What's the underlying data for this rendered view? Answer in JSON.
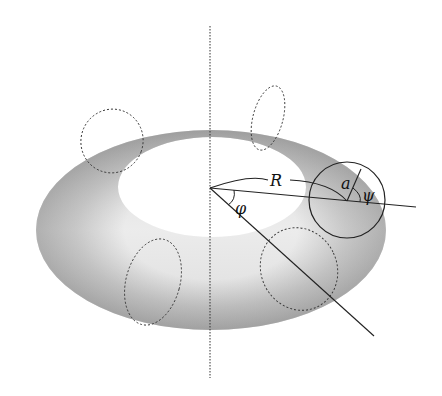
{
  "diagram": {
    "labels": {
      "major_radius": "R",
      "minor_radius": "a",
      "toroidal_angle": "φ",
      "poloidal_angle": "ψ"
    },
    "elements": [
      "vertical symmetry axis (dotted)",
      "shaded torus surface",
      "dashed cross-section ellipses (4)",
      "solid cross-section circle",
      "major radius arc R",
      "minor radius a",
      "angle φ between radial lines",
      "angle ψ at cross-section center"
    ]
  }
}
